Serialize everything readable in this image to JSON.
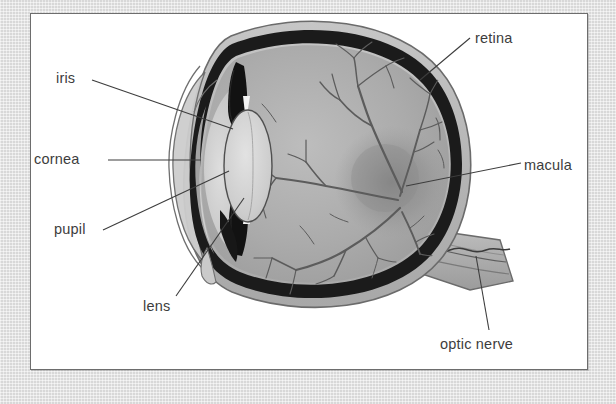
{
  "figure": {
    "type": "anatomical-diagram",
    "view": "sagittal cross-section, facing left",
    "style": "grayscale line-and-tone illustration",
    "panel": {
      "background_color": "#ffffff",
      "border_color": "#6d6d6d"
    },
    "page_background_color": "#d8d8d8"
  },
  "labels": {
    "iris": "iris",
    "cornea": "cornea",
    "pupil": "pupil",
    "lens": "lens",
    "retina": "retina",
    "macula": "macula",
    "optic_nerve": "optic nerve"
  },
  "label_positions": [
    {
      "name": "iris",
      "side": "left",
      "x": 56,
      "y": 70,
      "leader_to_x": 232,
      "leader_to_y": 129
    },
    {
      "name": "cornea",
      "side": "left",
      "x": 34,
      "y": 151,
      "leader_to_x": 200,
      "leader_to_y": 158
    },
    {
      "name": "pupil",
      "side": "left",
      "x": 54,
      "y": 221,
      "leader_to_x": 228,
      "leader_to_y": 172
    },
    {
      "name": "lens",
      "side": "left",
      "x": 143,
      "y": 298,
      "leader_to_x": 243,
      "leader_to_y": 199
    },
    {
      "name": "retina",
      "side": "right",
      "x": 475,
      "y": 30,
      "leader_to_x": 421,
      "leader_to_y": 79
    },
    {
      "name": "macula",
      "side": "right",
      "x": 524,
      "y": 157,
      "leader_to_x": 406,
      "leader_to_y": 186
    },
    {
      "name": "optic nerve",
      "side": "right",
      "x": 440,
      "y": 336,
      "leader_to_x": 476,
      "leader_to_y": 255
    }
  ],
  "colors": {
    "sclera": "#b9b9b9",
    "sclera_outline": "#6b6b6b",
    "choroid_dark": "#1d1d1d",
    "vitreous": "#a5a5a5",
    "vitreous_light": "#b5b5b5",
    "anterior_chamber": "#c3c3c3",
    "lens_fill": "#cfcfcf",
    "iris_black": "#141414",
    "macula_shade": "#8c8c8c",
    "vessel": "#5a5a5a",
    "label_text": "#3d3d3d",
    "leader_line": "#3d3d3d"
  },
  "structures": [
    {
      "name": "sclera",
      "description": "outer light-gray coat of the eyeball"
    },
    {
      "name": "choroid-retina",
      "description": "dark inner lining layer"
    },
    {
      "name": "vitreous-body",
      "description": "gray interior of the globe"
    },
    {
      "name": "cornea",
      "description": "transparent bulge at the front, left side"
    },
    {
      "name": "anterior-chamber",
      "description": "light area between cornea and lens"
    },
    {
      "name": "iris",
      "description": "black wedge structures above and below the lens"
    },
    {
      "name": "pupil",
      "description": "opening between the iris wedges"
    },
    {
      "name": "lens",
      "description": "pale lens-shaped ellipse behind the pupil"
    },
    {
      "name": "macula",
      "description": "darker shaded patch on the posterior retina"
    },
    {
      "name": "retinal-vessels",
      "description": "branching blood vessels radiating across the retina"
    },
    {
      "name": "optic-nerve",
      "description": "banded trunk leaving the globe at lower right"
    }
  ]
}
